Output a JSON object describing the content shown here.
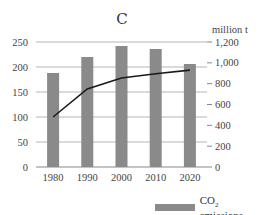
{
  "chart_data": {
    "type": "bar",
    "title": "C",
    "categories": [
      "1980",
      "1990",
      "2000",
      "2010",
      "2020"
    ],
    "series": [
      {
        "name": "CO2 emissions",
        "kind": "bar",
        "axis": "left",
        "color": "#8a8a8a",
        "values": [
          188,
          220,
          242,
          236,
          206
        ]
      },
      {
        "name": "line series (unlabeled)",
        "kind": "line",
        "axis": "right",
        "color": "#1a1a1a",
        "values": [
          480,
          750,
          855,
          895,
          930
        ]
      }
    ],
    "left_axis": {
      "label": "",
      "ylim": [
        0,
        250
      ],
      "ticks": [
        "0",
        "50",
        "100",
        "150",
        "200",
        "250"
      ]
    },
    "right_axis": {
      "label": "million t",
      "ylim": [
        0,
        1200
      ],
      "ticks": [
        "0",
        "200",
        "400",
        "600",
        "800",
        "1,000",
        "1,200"
      ]
    },
    "xlabel": "",
    "grid": true,
    "legend_position": "bottom-right"
  },
  "legend": {
    "label_prefix": "CO",
    "label_sub": "2",
    "label_suffix": " emissions"
  },
  "right_unit": "million t"
}
